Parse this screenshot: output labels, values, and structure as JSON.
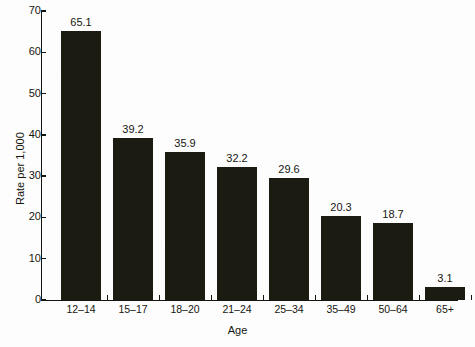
{
  "chart_data": {
    "type": "bar",
    "title": "",
    "xlabel": "Age",
    "ylabel": "Rate per 1,000",
    "categories": [
      "12–14",
      "15–17",
      "18–20",
      "21–24",
      "25–34",
      "35–49",
      "50–64",
      "65+"
    ],
    "values": [
      65.1,
      39.2,
      35.9,
      32.2,
      29.6,
      20.3,
      18.7,
      3.1
    ],
    "value_labels": [
      "65.1",
      "39.2",
      "35.9",
      "32.2",
      "29.6",
      "20.3",
      "18.7",
      "3.1"
    ],
    "ylim": [
      0,
      70
    ],
    "ytick_values": [
      0,
      10,
      20,
      30,
      40,
      50,
      60,
      70
    ],
    "ytick_labels": [
      "0",
      "10",
      "20",
      "30",
      "40",
      "50",
      "60",
      "70"
    ],
    "grid": false,
    "legend": false,
    "bar_color": "#1b1b12",
    "axis_color": "#15150f",
    "background_color": "#fdfdfd"
  }
}
